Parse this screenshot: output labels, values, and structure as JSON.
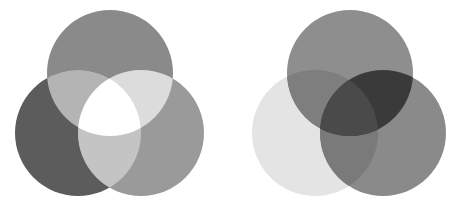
{
  "diagrams": [
    {
      "name": "additive-light-mixing",
      "circles": [
        {
          "id": "top",
          "color": "#8a8a8a"
        },
        {
          "id": "left",
          "color": "#5c5c5c"
        },
        {
          "id": "right",
          "color": "#9a9a9a"
        }
      ],
      "overlaps": {
        "top_left": "#b4b4b4",
        "top_right": "#dcdcdc",
        "left_right": "#c4c4c4",
        "all": "#ffffff"
      }
    },
    {
      "name": "subtractive-pigment-mixing",
      "circles": [
        {
          "id": "top",
          "color": "#8e8e8e"
        },
        {
          "id": "left",
          "color": "#e4e4e4"
        },
        {
          "id": "right",
          "color": "#8a8a8a"
        }
      ],
      "overlaps": {
        "top_left": "#7e7e7e",
        "top_right": "#3a3a3a",
        "left_right": "#7a7a7a",
        "all": "#4a4a4a"
      }
    }
  ]
}
